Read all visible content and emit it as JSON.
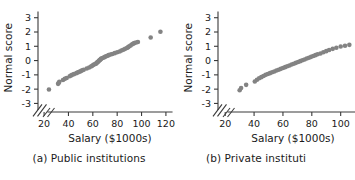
{
  "figure": {
    "marker_color": "#838383",
    "axis_color": "#3a3a3a",
    "axis_break_symbol": "//"
  },
  "chart_data": [
    {
      "type": "scatter",
      "title": "",
      "caption": "(a) Public institutions",
      "xlabel": "Salary ($1000s)",
      "ylabel": "Normal score",
      "xlim": [
        15,
        125
      ],
      "ylim": [
        -3.6,
        3.4
      ],
      "xticks": [
        20,
        40,
        60,
        80,
        100,
        120
      ],
      "yticks": [
        3,
        2,
        1,
        0,
        -1,
        -2,
        -3
      ],
      "ytick_labels": [
        "3",
        "2",
        "1",
        "0",
        "-1",
        "-2",
        "-3"
      ],
      "grid": false,
      "legend": "none",
      "axis_break": true,
      "x": [
        24.0,
        31.5,
        32.0,
        32.5,
        35.5,
        37.0,
        38.5,
        41.0,
        42.0,
        43.0,
        44.5,
        46.5,
        47.5,
        48.5,
        49.5,
        50.5,
        51.5,
        52.5,
        55.0,
        57.0,
        58.5,
        59.5,
        60.5,
        61.5,
        62.5,
        63.0,
        63.5,
        64.0,
        64.5,
        65.0,
        65.5,
        66.0,
        66.5,
        67.0,
        68.0,
        69.0,
        70.0,
        71.0,
        72.0,
        73.0,
        74.5,
        76.0,
        78.0,
        80.0,
        82.0,
        83.5,
        85.0,
        86.5,
        88.0,
        89.0,
        90.0,
        91.0,
        92.0,
        93.0,
        94.0,
        95.5,
        97.0,
        107.5,
        115.5
      ],
      "y": [
        -2.02,
        -1.63,
        -1.56,
        -1.48,
        -1.36,
        -1.28,
        -1.22,
        -1.1,
        -1.04,
        -1.0,
        -0.95,
        -0.88,
        -0.84,
        -0.8,
        -0.76,
        -0.72,
        -0.68,
        -0.64,
        -0.56,
        -0.48,
        -0.42,
        -0.36,
        -0.3,
        -0.26,
        -0.22,
        -0.18,
        -0.14,
        -0.1,
        -0.06,
        -0.02,
        0.02,
        0.06,
        0.1,
        0.14,
        0.18,
        0.22,
        0.26,
        0.3,
        0.34,
        0.38,
        0.42,
        0.46,
        0.52,
        0.58,
        0.64,
        0.7,
        0.76,
        0.82,
        0.88,
        0.94,
        1.0,
        1.06,
        1.12,
        1.18,
        1.22,
        1.26,
        1.3,
        1.62,
        2.02
      ]
    },
    {
      "type": "scatter",
      "title": "",
      "caption": "(b) Private instituti",
      "xlabel": "Salary ($1000s)",
      "ylabel": "Normal score",
      "xlim": [
        15,
        112
      ],
      "ylim": [
        -3.6,
        3.4
      ],
      "xticks": [
        20,
        40,
        60,
        80,
        100
      ],
      "yticks": [
        3,
        2,
        1,
        0,
        -1,
        -2,
        -3
      ],
      "ytick_labels": [
        "3",
        "2",
        "1",
        "0",
        "-1",
        "-2",
        "-3"
      ],
      "grid": false,
      "legend": "none",
      "axis_break": true,
      "x": [
        30.0,
        31.0,
        34.5,
        40.5,
        42.0,
        43.5,
        45.0,
        46.5,
        48.0,
        49.5,
        51.0,
        52.5,
        54.0,
        55.5,
        57.0,
        58.5,
        60.0,
        61.5,
        63.0,
        64.5,
        66.0,
        67.5,
        69.0,
        70.5,
        72.0,
        73.5,
        75.0,
        76.5,
        78.0,
        79.5,
        81.0,
        82.5,
        84.0,
        86.0,
        88.0,
        90.0,
        92.0,
        94.5,
        97.0,
        100.0,
        103.0,
        106.0
      ],
      "y": [
        -2.08,
        -1.92,
        -1.7,
        -1.46,
        -1.34,
        -1.24,
        -1.16,
        -1.08,
        -1.0,
        -0.94,
        -0.88,
        -0.82,
        -0.76,
        -0.7,
        -0.64,
        -0.58,
        -0.52,
        -0.46,
        -0.4,
        -0.34,
        -0.28,
        -0.22,
        -0.16,
        -0.1,
        -0.04,
        0.02,
        0.08,
        0.14,
        0.2,
        0.26,
        0.32,
        0.38,
        0.44,
        0.5,
        0.58,
        0.66,
        0.74,
        0.82,
        0.9,
        0.98,
        1.04,
        1.1
      ]
    }
  ]
}
